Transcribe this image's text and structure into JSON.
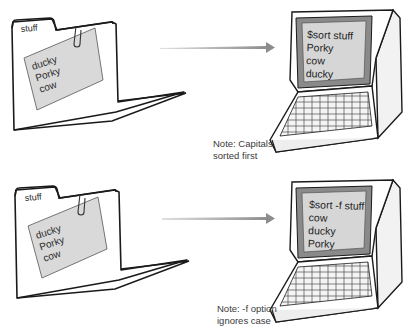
{
  "panels": [
    {
      "folder": {
        "tab_label": "stuff",
        "card_lines": [
          "ducky",
          "Porky",
          "cow"
        ]
      },
      "terminal": {
        "command": "$sort stuff",
        "output_lines": [
          "Porky",
          "cow",
          "ducky"
        ]
      },
      "note_lines": [
        "Note: Capitals",
        "sorted first"
      ]
    },
    {
      "folder": {
        "tab_label": "stuff",
        "card_lines": [
          "ducky",
          "Porky",
          "cow"
        ]
      },
      "terminal": {
        "command": "$sort -f stuff",
        "output_lines": [
          "cow",
          "ducky",
          "Porky"
        ]
      },
      "note_lines": [
        "Note: -f option",
        "ignores case"
      ]
    }
  ],
  "colors": {
    "card_fill": "#d9d9d9",
    "screen_fill": "#d6d6d6",
    "bezel_fill": "#8a8a8a",
    "arrow": "#909090",
    "outline": "#1a1a1a"
  },
  "icons": {
    "folder": "folder-icon",
    "paperclip": "paperclip-icon",
    "arrow": "arrow-right-icon",
    "computer": "computer-terminal-icon"
  }
}
